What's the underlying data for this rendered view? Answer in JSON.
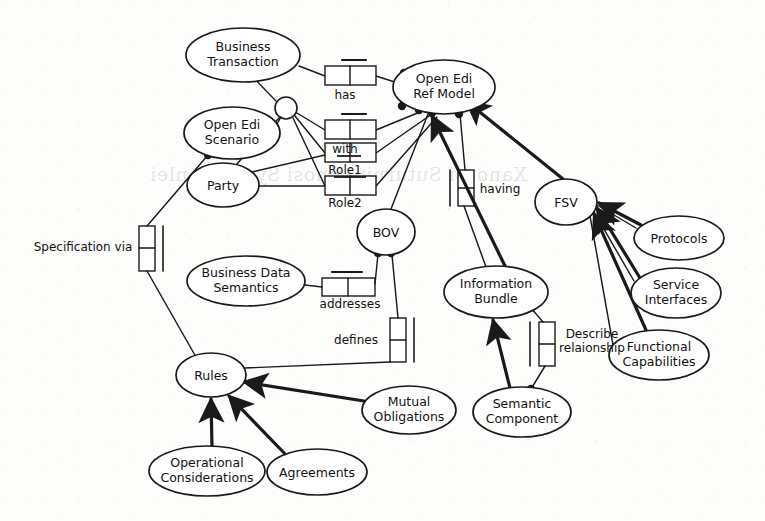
{
  "diagram": {
    "type": "uml-class-association-diagram",
    "stroke_color": "#1a1a1a",
    "fill_color": "#ffffff",
    "background_color": "#fdfdfb",
    "nodes": [
      {
        "id": "business_transaction",
        "label_line1": "Business",
        "label_line2": "Transaction",
        "cx": 243,
        "cy": 55,
        "rx": 57,
        "ry": 27
      },
      {
        "id": "open_edi_ref_model",
        "label_line1": "Open Edi",
        "label_line2": "Ref Model",
        "cx": 444,
        "cy": 87,
        "rx": 51,
        "ry": 27
      },
      {
        "id": "open_edi_scenario",
        "label_line1": "Open Edi",
        "label_line2": "Scenario",
        "cx": 232,
        "cy": 133,
        "rx": 48,
        "ry": 26
      },
      {
        "id": "party",
        "label_line1": "Party",
        "label_line2": "",
        "cx": 223,
        "cy": 185,
        "rx": 36,
        "ry": 22
      },
      {
        "id": "fsv",
        "label_line1": "FSV",
        "label_line2": "",
        "cx": 566,
        "cy": 202,
        "rx": 31,
        "ry": 23
      },
      {
        "id": "protocols",
        "label_line1": "Protocols",
        "label_line2": "",
        "cx": 679,
        "cy": 238,
        "rx": 45,
        "ry": 22
      },
      {
        "id": "bov",
        "label_line1": "BOV",
        "label_line2": "",
        "cx": 386,
        "cy": 232,
        "rx": 29,
        "ry": 23
      },
      {
        "id": "business_data_semantics",
        "label_line1": "Business Data",
        "label_line2": "Semantics",
        "cx": 246,
        "cy": 281,
        "rx": 59,
        "ry": 25
      },
      {
        "id": "information_bundle",
        "label_line1": "Information",
        "label_line2": "Bundle",
        "cx": 496,
        "cy": 292,
        "rx": 52,
        "ry": 26
      },
      {
        "id": "service_interfaces",
        "label_line1": "Service",
        "label_line2": "Interfaces",
        "cx": 676,
        "cy": 293,
        "rx": 45,
        "ry": 25
      },
      {
        "id": "functional_capabilities",
        "label_line1": "Functional",
        "label_line2": "Capabilities",
        "cx": 659,
        "cy": 355,
        "rx": 50,
        "ry": 25
      },
      {
        "id": "rules",
        "label_line1": "Rules",
        "label_line2": "",
        "cx": 211,
        "cy": 375,
        "rx": 35,
        "ry": 22
      },
      {
        "id": "mutual_obligations",
        "label_line1": "Mutual",
        "label_line2": "Obligations",
        "cx": 409,
        "cy": 410,
        "rx": 47,
        "ry": 24
      },
      {
        "id": "semantic_component",
        "label_line1": "Semantic",
        "label_line2": "Component",
        "cx": 522,
        "cy": 412,
        "rx": 49,
        "ry": 25
      },
      {
        "id": "operational_considerations",
        "label_line1": "Operational",
        "label_line2": "Considerations",
        "cx": 207,
        "cy": 471,
        "rx": 58,
        "ry": 25
      },
      {
        "id": "agreements",
        "label_line1": "Agreements",
        "label_line2": "",
        "cx": 317,
        "cy": 472,
        "rx": 50,
        "ry": 23
      }
    ],
    "association_labels": [
      {
        "id": "has",
        "text": "has",
        "x": 345,
        "y": 91
      },
      {
        "id": "with",
        "text": "with",
        "x": 345,
        "y": 146
      },
      {
        "id": "role1",
        "text": "Role1",
        "x": 345,
        "y": 167
      },
      {
        "id": "role2",
        "text": "Role2",
        "x": 345,
        "y": 200
      },
      {
        "id": "specification_via",
        "text": "Specification via",
        "x": 83,
        "y": 247
      },
      {
        "id": "addresses",
        "text": "addresses",
        "x": 350,
        "y": 300
      },
      {
        "id": "defines",
        "text": "defines",
        "x": 351,
        "y": 334
      },
      {
        "id": "having",
        "text": "having",
        "x": 498,
        "y": 194
      },
      {
        "id": "describe_relationship_l1",
        "text": "Describe",
        "x": 592,
        "y": 334
      },
      {
        "id": "describe_relationship_l2",
        "text": "relaionship",
        "x": 592,
        "y": 348
      }
    ],
    "ghost_text": [
      {
        "id": "ghost-upper",
        "text": "Xanoroi  Suturniulmnosi  Syslen  [enlei",
        "x": 150,
        "y": 163
      }
    ]
  }
}
